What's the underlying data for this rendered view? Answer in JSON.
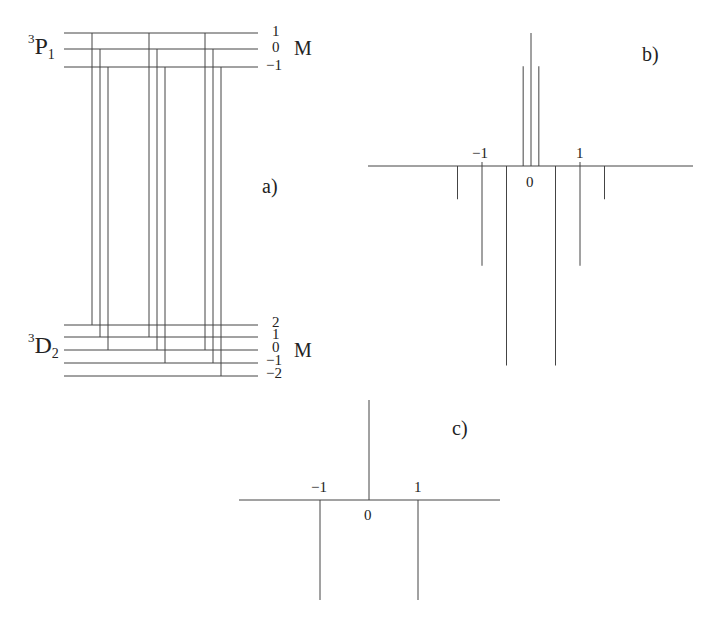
{
  "panel_a": {
    "label": "a)",
    "upper_term": {
      "sup": "3",
      "letter": "P",
      "sub": "1"
    },
    "lower_term": {
      "sup": "3",
      "letter": "D",
      "sub": "2"
    },
    "upper_M_values": [
      "1",
      "0",
      "−1"
    ],
    "lower_M_values": [
      "2",
      "1",
      "0",
      "−1",
      "−2"
    ],
    "M_label": "M",
    "upper_levels_y": [
      33,
      49,
      67
    ],
    "lower_levels_y": [
      325,
      337,
      350,
      363,
      376
    ],
    "transitions": [
      {
        "x": 92,
        "from_M": 1,
        "to_M": 2
      },
      {
        "x": 100,
        "from_M": 0,
        "to_M": 1
      },
      {
        "x": 108,
        "from_M": -1,
        "to_M": 0
      },
      {
        "x": 149,
        "from_M": 1,
        "to_M": 1
      },
      {
        "x": 157,
        "from_M": 0,
        "to_M": 0
      },
      {
        "x": 165,
        "from_M": -1,
        "to_M": -1
      },
      {
        "x": 205,
        "from_M": 1,
        "to_M": 0
      },
      {
        "x": 213,
        "from_M": 0,
        "to_M": -1
      },
      {
        "x": 221,
        "from_M": -1,
        "to_M": -2
      }
    ]
  },
  "panel_b": {
    "label": "b)",
    "tick_labels": {
      "minus_one": "−1",
      "zero": "0",
      "one": "1"
    }
  },
  "panel_c": {
    "label": "c)",
    "tick_labels": {
      "minus_one": "−1",
      "zero": "0",
      "one": "1"
    }
  },
  "chart_data": [
    {
      "type": "bar",
      "title": "b)",
      "description": "Zeeman pattern (stick spectrum), positive = upward, negative = downward",
      "x": [
        -1.5,
        -1.0,
        -0.5,
        -0.17,
        0,
        0.17,
        0.5,
        1.0,
        1.5
      ],
      "values": [
        -0.25,
        -0.75,
        -1.5,
        0.75,
        1.0,
        0.75,
        -1.5,
        -0.75,
        -0.25
      ],
      "xlabel": "",
      "ylabel": "",
      "tick_labels": [
        "−1",
        "0",
        "1"
      ]
    },
    {
      "type": "bar",
      "title": "c)",
      "x": [
        -1,
        0,
        1
      ],
      "values": [
        -1.0,
        1.0,
        -1.0
      ],
      "xlabel": "",
      "ylabel": "",
      "tick_labels": [
        "−1",
        "0",
        "1"
      ]
    }
  ]
}
